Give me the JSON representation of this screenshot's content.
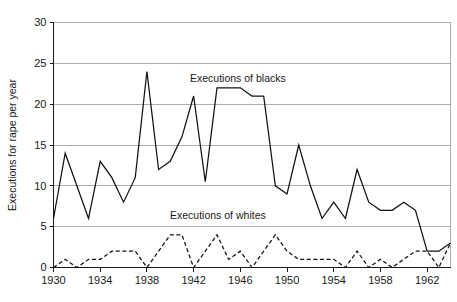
{
  "chart_data": {
    "type": "line",
    "title": "",
    "xlabel": "",
    "ylabel": "Executions for rape per year",
    "xlim": [
      1930,
      1964
    ],
    "ylim": [
      0,
      30
    ],
    "yticks": [
      0,
      5,
      10,
      15,
      20,
      25,
      30
    ],
    "ytick_labels": [
      "0",
      "5",
      "10",
      "15",
      "20",
      "25",
      "30"
    ],
    "xticks": [
      1930,
      1934,
      1938,
      1942,
      1946,
      1950,
      1954,
      1958,
      1962
    ],
    "xtick_labels": [
      "1930",
      "1934",
      "1938",
      "1942",
      "1946",
      "1950",
      "1954",
      "1958",
      "1962"
    ],
    "grid": "horizontal",
    "legend": "inline-annotations",
    "x": [
      1930,
      1931,
      1932,
      1933,
      1934,
      1935,
      1936,
      1937,
      1938,
      1939,
      1940,
      1941,
      1942,
      1943,
      1944,
      1945,
      1946,
      1947,
      1948,
      1949,
      1950,
      1951,
      1952,
      1953,
      1954,
      1955,
      1956,
      1957,
      1958,
      1959,
      1960,
      1961,
      1962,
      1963,
      1964
    ],
    "series": [
      {
        "name": "Executions of blacks",
        "style": "solid",
        "color": "#111111",
        "annotation": "Executions of blacks",
        "values": [
          6,
          14,
          10,
          6,
          13,
          11,
          8,
          11,
          24,
          12,
          13,
          16,
          21,
          10.5,
          22,
          22,
          22,
          21,
          21,
          10,
          9,
          15,
          10,
          6,
          8,
          6,
          12,
          8,
          7,
          7,
          8,
          7,
          2,
          2,
          3
        ]
      },
      {
        "name": "Executions of whites",
        "style": "dashed",
        "color": "#111111",
        "annotation": "Executions of whites",
        "values": [
          0,
          1,
          0,
          1,
          1,
          2,
          2,
          2,
          0,
          2,
          4,
          4,
          0,
          2,
          4,
          1,
          2,
          0,
          2,
          4,
          2,
          1,
          1,
          1,
          1,
          0,
          2,
          0,
          1,
          0,
          1,
          2,
          2,
          0,
          3
        ]
      }
    ]
  },
  "annotations": {
    "blacks_label": "Executions of blacks",
    "whites_label": "Executions of whites"
  },
  "axes": {
    "y_title": "Executions for rape per year"
  }
}
